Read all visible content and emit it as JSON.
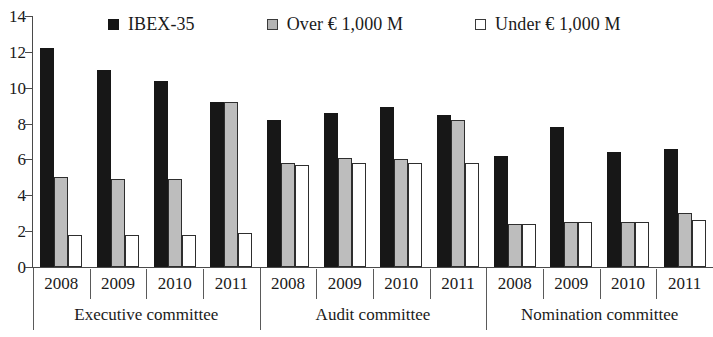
{
  "chart_data": {
    "type": "bar",
    "title": "",
    "subtitle": "",
    "xlabel": "",
    "ylabel": "",
    "ylim": [
      0,
      14
    ],
    "y_ticks": [
      0,
      2,
      4,
      6,
      8,
      10,
      12,
      14
    ],
    "grid": false,
    "legend_position": "top",
    "categories": [
      "2008",
      "2009",
      "2010",
      "2011",
      "2008",
      "2009",
      "2010",
      "2011",
      "2008",
      "2009",
      "2010",
      "2011"
    ],
    "groups": [
      {
        "label": "Executive committee",
        "categories": [
          "2008",
          "2009",
          "2010",
          "2011"
        ]
      },
      {
        "label": "Audit committee",
        "categories": [
          "2008",
          "2009",
          "2010",
          "2011"
        ]
      },
      {
        "label": "Nomination committee",
        "categories": [
          "2008",
          "2009",
          "2010",
          "2011"
        ]
      }
    ],
    "series": [
      {
        "name": "IBEX-35",
        "color": "#171717",
        "style": "filled-black",
        "values": [
          12.2,
          11.0,
          10.4,
          9.2,
          8.2,
          8.6,
          8.9,
          8.5,
          6.2,
          7.8,
          6.4,
          6.6
        ]
      },
      {
        "name": "Over € 1,000 M",
        "color": "#bdbdbd",
        "style": "filled-gray",
        "values": [
          5.0,
          4.9,
          4.9,
          9.2,
          5.8,
          6.1,
          6.0,
          8.2,
          2.4,
          2.5,
          2.5,
          3.0
        ]
      },
      {
        "name": "Under € 1,000 M",
        "color": "#ffffff",
        "style": "outlined-white",
        "values": [
          1.8,
          1.8,
          1.8,
          1.9,
          5.7,
          5.8,
          5.8,
          5.8,
          2.4,
          2.5,
          2.5,
          2.6
        ]
      }
    ]
  },
  "legend": {
    "items": [
      {
        "label": "IBEX-35",
        "swatch": "black-square-icon"
      },
      {
        "label": "Over € 1,000 M",
        "swatch": "gray-square-icon"
      },
      {
        "label": "Under € 1,000 M",
        "swatch": "white-square-icon"
      }
    ]
  }
}
